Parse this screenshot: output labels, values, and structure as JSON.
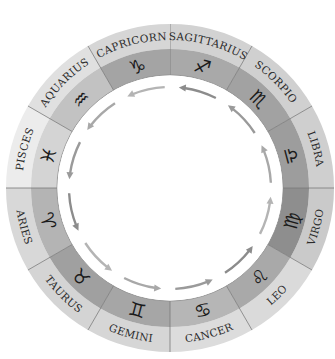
{
  "diagram": {
    "center": [
      170,
      188
    ],
    "radii": {
      "outer": 164,
      "label_inner": 139,
      "symbol_inner": 113,
      "arrow_ring": 101
    },
    "colors": {
      "divider": "#7a7a7a",
      "arrow": "#9a9a9a",
      "label_text": "#2a2a2a",
      "symbol_text": "#1a1a1a"
    },
    "signs": [
      {
        "name": "SAGITTARIUS",
        "symbol": "♐",
        "start_deg": 0,
        "label_fill": "#d2d2d2",
        "symbol_fill": "#a9a9a9"
      },
      {
        "name": "SCORPIO",
        "symbol": "♏",
        "start_deg": 30,
        "label_fill": "#d0d0d0",
        "symbol_fill": "#a2a2a2"
      },
      {
        "name": "LIBRA",
        "symbol": "♎",
        "start_deg": 60,
        "label_fill": "#cfcfcf",
        "symbol_fill": "#9d9d9d"
      },
      {
        "name": "VIRGO",
        "symbol": "♍",
        "start_deg": 90,
        "label_fill": "#cacaca",
        "symbol_fill": "#8e8e8e"
      },
      {
        "name": "LEO",
        "symbol": "♌",
        "start_deg": 120,
        "label_fill": "#dadada",
        "symbol_fill": "#a9a9a9"
      },
      {
        "name": "CANCER",
        "symbol": "♋",
        "start_deg": 150,
        "label_fill": "#dcdcdc",
        "symbol_fill": "#b6b6b6"
      },
      {
        "name": "GEMINI",
        "symbol": "♊",
        "start_deg": 180,
        "label_fill": "#d6d6d6",
        "symbol_fill": "#a6a6a6"
      },
      {
        "name": "TAURUS",
        "symbol": "♉",
        "start_deg": 210,
        "label_fill": "#d4d4d4",
        "symbol_fill": "#a0a0a0"
      },
      {
        "name": "ARIES",
        "symbol": "♈",
        "start_deg": 240,
        "label_fill": "#d8d8d8",
        "symbol_fill": "#b4b4b4"
      },
      {
        "name": "PISCES",
        "symbol": "♓",
        "start_deg": 270,
        "label_fill": "#ececec",
        "symbol_fill": "#d4d4d4"
      },
      {
        "name": "AQUARIUS",
        "symbol": "♒",
        "start_deg": 300,
        "label_fill": "#e0e0e0",
        "symbol_fill": "#c2c2c2"
      },
      {
        "name": "CAPRICORN",
        "symbol": "♑",
        "start_deg": 330,
        "label_fill": "#d6d6d6",
        "symbol_fill": "#a4a4a4"
      }
    ],
    "arrows": {
      "count": 12,
      "direction": "counterclockwise"
    }
  }
}
